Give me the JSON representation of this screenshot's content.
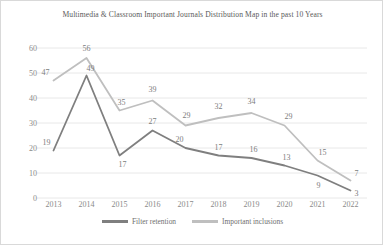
{
  "chart_data": {
    "type": "line",
    "title": "Multimedia & Classroom Important Journals Distribution Map in the past 10 Years",
    "xlabel": "",
    "ylabel": "",
    "categories": [
      "2013",
      "2014",
      "2015",
      "2016",
      "2017",
      "2018",
      "2019",
      "2020",
      "2021",
      "2022"
    ],
    "ylim": [
      0,
      60
    ],
    "yticks": [
      "0",
      "10",
      "20",
      "30",
      "40",
      "50",
      "60"
    ],
    "grid": true,
    "legend_position": "bottom",
    "series": [
      {
        "name": "Filter retention",
        "color": "#7f7f7f",
        "values": [
          19,
          49,
          17,
          27,
          20,
          17,
          16,
          13,
          9,
          3
        ]
      },
      {
        "name": "Important inclusions",
        "color": "#bfbfbf",
        "values": [
          47,
          56,
          35,
          39,
          29,
          32,
          34,
          29,
          15,
          7
        ]
      }
    ]
  },
  "colors": {
    "series_dark": "#7f7f7f",
    "series_light": "#bfbfbf",
    "grid": "#e8e8e8",
    "text": "#8a8a8a",
    "title": "#5a5a5a",
    "border": "#d9d9d9"
  }
}
